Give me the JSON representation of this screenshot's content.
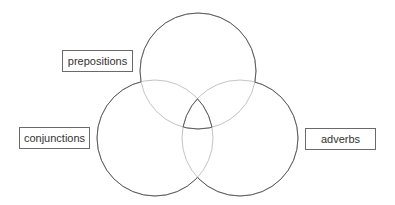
{
  "diagram": {
    "type": "venn",
    "sets": [
      {
        "id": "prepositions",
        "label": "prepositions"
      },
      {
        "id": "conjunctions",
        "label": "conjunctions"
      },
      {
        "id": "adverbs",
        "label": "adverbs"
      }
    ],
    "colors": {
      "outer_stroke": "#5a5a5a",
      "inner_stroke": "#c4c4c4",
      "label_border": "#6a6a6a",
      "label_text": "#333333"
    }
  }
}
